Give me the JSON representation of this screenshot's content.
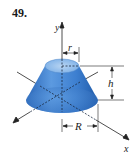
{
  "figure": {
    "problem_number": "49.",
    "axis_labels": {
      "y": "y",
      "x": "x"
    },
    "dimension_labels": {
      "top_radius": "r",
      "height": "h",
      "bottom_radius": "R"
    },
    "shape": "frustum-of-cone",
    "colors": {
      "solid_fill": "#3b7fd0",
      "solid_light": "#8fbcea",
      "solid_dark": "#1f5aa8",
      "lines": "#222222"
    }
  }
}
